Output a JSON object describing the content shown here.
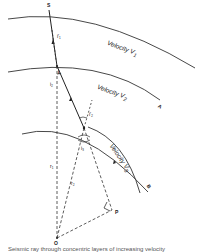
{
  "figure": {
    "points": {
      "source": "S",
      "first_interface_point": "L",
      "center": "O",
      "foot": "P",
      "interface_a": "A",
      "interface_b": "B"
    },
    "layers": [
      {
        "label": "Velocity V",
        "sub": "1"
      },
      {
        "label": "Velocity V",
        "sub": "2"
      },
      {
        "label": "Velocity V",
        "sub": "3"
      }
    ],
    "angles": {
      "i1p": "i′₁",
      "i2": "i₂",
      "i2p": "i′₂",
      "i3": "i₃"
    },
    "radii": {
      "r1": "r₁",
      "r2": "r₂"
    },
    "caption": "Seismic ray through concentric layers of increasing velocity"
  }
}
